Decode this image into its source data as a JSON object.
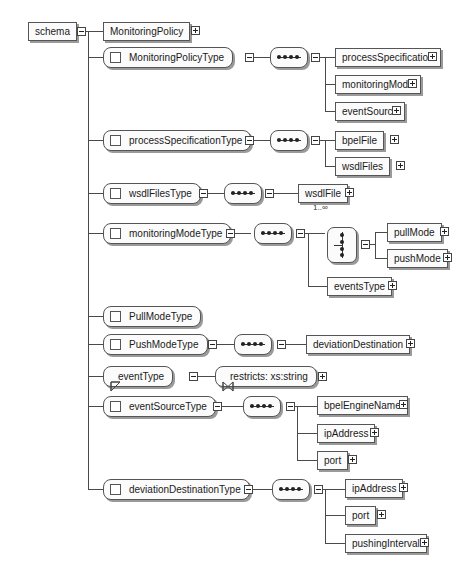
{
  "root": {
    "label": "schema",
    "toggle": "collapse"
  },
  "global_element": {
    "label": "MonitoringPolicy",
    "toggle": "expand"
  },
  "complex_types": [
    {
      "label": "MonitoringPolicyType",
      "compositor": "sequence",
      "children": [
        {
          "label": "processSpecification",
          "toggle": "expand"
        },
        {
          "label": "monitoringMode",
          "toggle": "expand"
        },
        {
          "label": "eventSource",
          "toggle": "expand"
        }
      ]
    },
    {
      "label": "processSpecificationType",
      "compositor": "sequence",
      "children": [
        {
          "label": "bpelFile",
          "toggle": "expand"
        },
        {
          "label": "wsdlFiles",
          "toggle": "expand"
        }
      ]
    },
    {
      "label": "wsdlFilesType",
      "compositor": "sequence",
      "children": [
        {
          "label": "wsdlFile",
          "toggle": "expand",
          "multiplicity": "1..∞"
        }
      ]
    },
    {
      "label": "monitoringModeType",
      "compositor": "sequence",
      "choice": {
        "compositor": "choice",
        "children": [
          {
            "label": "pullMode",
            "toggle": "expand"
          },
          {
            "label": "pushMode",
            "toggle": "expand"
          }
        ]
      },
      "children": [
        {
          "label": "eventsType",
          "toggle": "expand"
        }
      ]
    },
    {
      "label": "PullModeType"
    },
    {
      "label": "PushModeType",
      "compositor": "sequence",
      "children": [
        {
          "label": "deviationDestination",
          "toggle": "expand"
        }
      ]
    },
    {
      "label": "eventSourceType",
      "compositor": "sequence",
      "children": [
        {
          "label": "bpelEngineName",
          "toggle": "expand"
        },
        {
          "label": "ipAddress",
          "toggle": "expand"
        },
        {
          "label": "port",
          "toggle": "expand"
        }
      ]
    },
    {
      "label": "deviationDestinationType",
      "compositor": "sequence",
      "children": [
        {
          "label": "ipAddress",
          "toggle": "expand"
        },
        {
          "label": "port",
          "toggle": "expand"
        },
        {
          "label": "pushingInterval",
          "toggle": "expand"
        }
      ]
    }
  ],
  "simple_types": [
    {
      "label": "eventType",
      "restriction": "restricts: xs:string",
      "toggle": "expand"
    }
  ],
  "icons": {
    "complex_type": "square-icon",
    "simple_type": "triangle-icon",
    "restriction": "bowtie-icon",
    "sequence": "sequence-dots-icon",
    "choice": "choice-switch-icon",
    "expand": "plus-box-icon",
    "collapse": "minus-box-icon"
  },
  "colors": {
    "line": "#4a4a4a",
    "border": "#555555",
    "shadow": "#9a9a9a",
    "box_fill": "#fbfbfb"
  }
}
